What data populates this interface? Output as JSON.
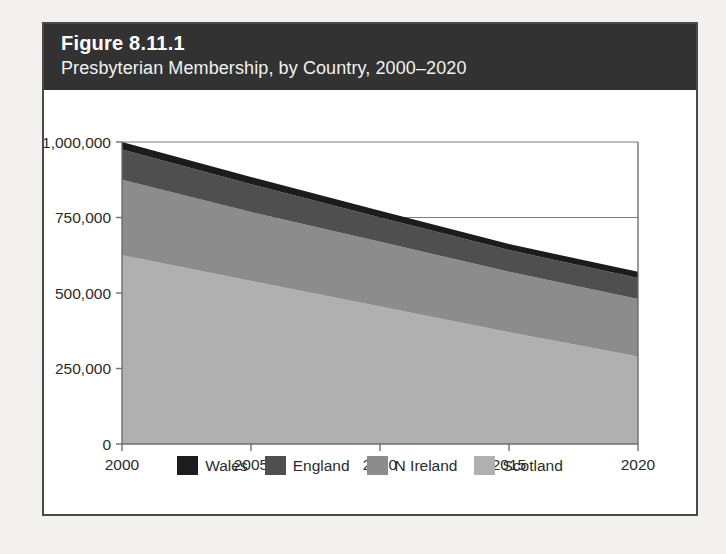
{
  "figure": {
    "number": "Figure 8.11.1",
    "title": "Presbyterian Membership, by Country, 2000–2020"
  },
  "colors": {
    "header_band": "#333233",
    "card_border": "#4a4a4a",
    "page_background": "#f2f1ef",
    "axis": "#6e6e6e",
    "gridline": "#7a7a7a",
    "text": "#2b2b2b"
  },
  "chart_data": {
    "type": "area",
    "stacked": true,
    "title": "Presbyterian Membership, by Country, 2000–2020",
    "xlabel": "",
    "ylabel": "",
    "x": [
      2000,
      2005,
      2010,
      2015,
      2020
    ],
    "xlim": [
      2000,
      2020
    ],
    "ylim": [
      0,
      1000000
    ],
    "xticks": [
      2000,
      2005,
      2010,
      2015,
      2020
    ],
    "xtick_labels": [
      "2000",
      "2005",
      "2010",
      "2015",
      "2020"
    ],
    "yticks": [
      0,
      250000,
      500000,
      750000,
      1000000
    ],
    "ytick_labels": [
      "0",
      "250,000",
      "500,000",
      "750,000",
      "1,000,000"
    ],
    "grid": "horizontal-at-750000-and-1000000",
    "legend_position": "bottom-center",
    "stack_order_top_to_bottom": [
      "Wales",
      "England",
      "N Ireland",
      "Scotland"
    ],
    "series": [
      {
        "name": "Scotland",
        "color": "#b0b0b0",
        "values": [
          625000,
          540000,
          455000,
          370000,
          290000
        ]
      },
      {
        "name": "N Ireland",
        "color": "#8c8c8c",
        "values": [
          250000,
          228000,
          215000,
          200000,
          190000
        ]
      },
      {
        "name": "England",
        "color": "#4f4f4f",
        "values": [
          100000,
          92000,
          80000,
          72000,
          70000
        ]
      },
      {
        "name": "Wales",
        "color": "#1c1c1c",
        "values": [
          25000,
          24000,
          22000,
          20000,
          20000
        ]
      }
    ],
    "totals": [
      1000000,
      884000,
      772000,
      662000,
      570000
    ]
  },
  "legend": {
    "items": [
      {
        "label": "Wales",
        "color": "#1c1c1c"
      },
      {
        "label": "England",
        "color": "#4f4f4f"
      },
      {
        "label": "N Ireland",
        "color": "#8c8c8c"
      },
      {
        "label": "Scotland",
        "color": "#b0b0b0"
      }
    ]
  }
}
